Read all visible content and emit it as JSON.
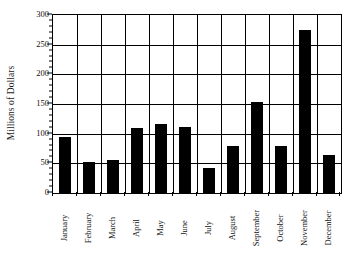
{
  "chart_data": {
    "type": "bar",
    "title": "",
    "subtitle": "",
    "xlabel": "",
    "ylabel": "Millions of Dollars",
    "categories": [
      "January",
      "February",
      "March",
      "April",
      "May",
      "June",
      "July",
      "August",
      "September",
      "October",
      "November",
      "December"
    ],
    "values": [
      95,
      53,
      55,
      110,
      116,
      112,
      43,
      80,
      154,
      80,
      275,
      64
    ],
    "series": [
      {
        "name": "Millions of Dollars",
        "values": [
          95,
          53,
          55,
          110,
          116,
          112,
          43,
          80,
          154,
          80,
          275,
          64
        ]
      }
    ],
    "ylim": [
      0,
      300
    ],
    "xlim_categories": 12,
    "y_major_ticks": [
      0,
      50,
      100,
      150,
      200,
      250,
      300
    ],
    "y_minor_tick_interval": 10,
    "y_tick_labels": [
      "0",
      "50",
      "100",
      "150",
      "200",
      "250",
      "300"
    ],
    "grid": {
      "horizontal": true,
      "vertical": true,
      "horizontal_at": [
        50,
        100,
        150,
        200,
        250
      ],
      "vertical_between_categories": true
    },
    "legend": {
      "visible": false,
      "position": "none",
      "entries": []
    },
    "colors": {
      "bar_fill": "#000000",
      "background": "#ffffff",
      "axis": "#000000",
      "grid": "#000000",
      "text": "#111111"
    },
    "annotations": [],
    "x_tick_label_rotation": 90,
    "y_axis_title_rotation": 90
  }
}
